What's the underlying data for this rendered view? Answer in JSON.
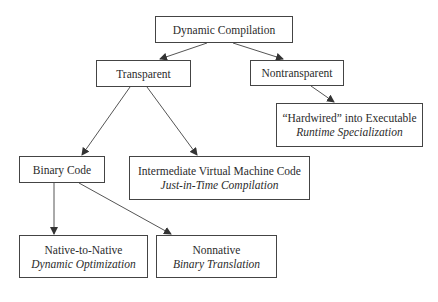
{
  "diagram": {
    "nodes": {
      "root": {
        "label": "Dynamic Compilation"
      },
      "transparent": {
        "label": "Transparent"
      },
      "nontransparent": {
        "label": "Nontransparent"
      },
      "hardwired": {
        "label": "“Hardwired” into Executable",
        "sublabel": "Runtime Specialization"
      },
      "binary": {
        "label": "Binary Code"
      },
      "ivm": {
        "label": "Intermediate Virtual Machine Code",
        "sublabel": "Just-in-Time Compilation"
      },
      "native": {
        "label": "Native-to-Native",
        "sublabel": "Dynamic Optimization"
      },
      "nonnative": {
        "label": "Nonnative",
        "sublabel": "Binary Translation"
      }
    },
    "edges": [
      {
        "from": "root",
        "to": "transparent"
      },
      {
        "from": "root",
        "to": "nontransparent"
      },
      {
        "from": "nontransparent",
        "to": "hardwired"
      },
      {
        "from": "transparent",
        "to": "binary"
      },
      {
        "from": "transparent",
        "to": "ivm"
      },
      {
        "from": "binary",
        "to": "native"
      },
      {
        "from": "binary",
        "to": "nonnative"
      }
    ],
    "colors": {
      "stroke": "#444444",
      "text": "#2b2b2b",
      "background": "#ffffff"
    }
  }
}
